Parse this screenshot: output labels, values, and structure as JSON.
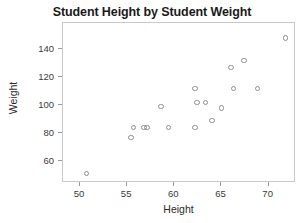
{
  "chart_data": {
    "type": "scatter",
    "title": "Student Height by Student Weight",
    "xlabel": "Height",
    "ylabel": "Weight",
    "xlim": [
      48.2,
      72.9
    ],
    "ylim": [
      44.3,
      158.6
    ],
    "grid": false,
    "legend": null,
    "xticks": [
      50,
      55,
      60,
      65,
      70
    ],
    "yticks": [
      60,
      80,
      100,
      120,
      140
    ],
    "marker": "open-circle",
    "marker_color": "#8d8d8d",
    "points": [
      {
        "x": 50.7,
        "y": 51
      },
      {
        "x": 55.4,
        "y": 77
      },
      {
        "x": 55.7,
        "y": 84
      },
      {
        "x": 56.8,
        "y": 84
      },
      {
        "x": 57.1,
        "y": 84
      },
      {
        "x": 58.6,
        "y": 99
      },
      {
        "x": 59.4,
        "y": 84
      },
      {
        "x": 62.2,
        "y": 112
      },
      {
        "x": 62.2,
        "y": 84
      },
      {
        "x": 62.4,
        "y": 102
      },
      {
        "x": 63.3,
        "y": 102
      },
      {
        "x": 64.0,
        "y": 89
      },
      {
        "x": 65.0,
        "y": 98
      },
      {
        "x": 66.0,
        "y": 127
      },
      {
        "x": 66.3,
        "y": 112
      },
      {
        "x": 67.4,
        "y": 132
      },
      {
        "x": 68.8,
        "y": 112
      },
      {
        "x": 71.8,
        "y": 148
      }
    ]
  }
}
